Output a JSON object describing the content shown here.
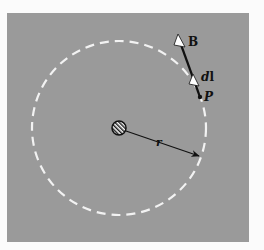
{
  "figure": {
    "colors": {
      "page_background": "#fbfbfb",
      "panel_background": "#9a9a9a",
      "dashed_circle": "#f2f2f2",
      "ink": "#111111",
      "arrowhead_fill": "#ffffff"
    },
    "labels": {
      "field": "B",
      "element": "dl",
      "element_d": "d",
      "element_l": "l",
      "point": "P",
      "radius": "r"
    },
    "elements": {
      "wire": "current-carrying wire seen end-on (hatched circle)",
      "path": "dashed circular Amperian loop",
      "radius_arrow": "arrow from wire to loop",
      "field_vector": "B vector tangent at P",
      "length_element": "dl vector tangent at P"
    }
  }
}
